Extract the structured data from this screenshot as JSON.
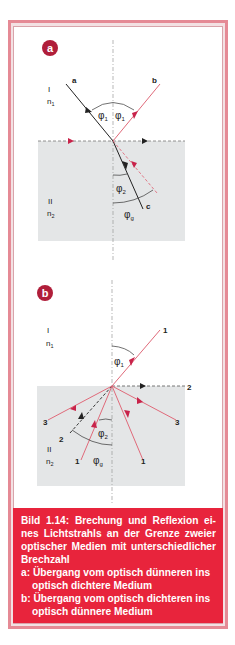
{
  "figure": {
    "panel_a": {
      "badge": "a",
      "medium_1_label": "I",
      "medium_1_index": "n",
      "medium_1_sub": "1",
      "medium_2_label": "II",
      "medium_2_index": "n",
      "medium_2_sub": "2",
      "ray_labels": [
        "a",
        "b",
        "c"
      ],
      "angle_phi": "φ",
      "angle_1_sub": "1",
      "angle_2_sub": "2",
      "angle_g_sub": "g"
    },
    "panel_b": {
      "badge": "b",
      "medium_1_label": "I",
      "medium_1_index": "n",
      "medium_1_sub": "1",
      "medium_2_label": "II",
      "medium_2_index": "n",
      "medium_2_sub": "2",
      "ray_labels": [
        "1",
        "2",
        "3",
        "3",
        "2",
        "1",
        "1"
      ],
      "angle_phi": "φ",
      "angle_1_sub": "1",
      "angle_2_sub": "2",
      "angle_g_sub": "g"
    },
    "colors": {
      "frame": "#e58a95",
      "badge": "#b01e3a",
      "caption_bg": "#e8243c",
      "medium_2_fill": "#e4e6e7",
      "ray_red": "#e06a7a",
      "arrow_red": "#c8234a",
      "ray_black": "#222222"
    }
  },
  "caption": {
    "line1": "Bild 1.14: Brechung und Reflexion ei-",
    "line2": "nes Lichtstrahls an der Grenze zweier",
    "line3": "optischer Medien mit unterschiedlicher",
    "line4": "Brechzahl",
    "item_a_line1": "a: Übergang vom optisch dünneren ins",
    "item_a_line2": "optisch dichtere Medium",
    "item_b_line1": "b: Übergang vom optisch dichteren ins",
    "item_b_line2": "optisch dünnere Medium"
  }
}
